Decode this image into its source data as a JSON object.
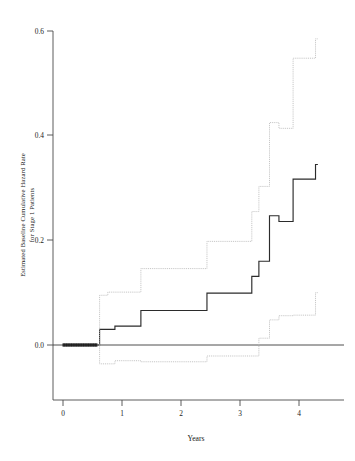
{
  "chart_data": {
    "type": "line",
    "title": "",
    "subtitle": "",
    "xlabel": "Years",
    "ylabel": "Estimated Baseline Cumulative Hazard Rate for Stage 1 Patients",
    "ylabel_line1": "Estimated Baseline Cumulative Hazard Rate",
    "ylabel_line2": "for Stage 1 Patients",
    "xlim": [
      -0.18,
      4.75
    ],
    "ylim": [
      -0.085,
      0.63
    ],
    "xticks": [
      0,
      1,
      2,
      3,
      4
    ],
    "xticklabels": [
      "0",
      "1",
      "2",
      "3",
      "4"
    ],
    "yticks": [
      0.0,
      0.2,
      0.4,
      0.6
    ],
    "yticklabels": [
      "0.0",
      "0.2",
      "0.4",
      "0.6"
    ],
    "grid": false,
    "legend": "none",
    "step_type": "post",
    "reference_line_y": 0.0,
    "series": [
      {
        "name": "Estimated baseline cumulative hazard",
        "style": "solid",
        "color": "#2b2b2b",
        "x": [
          0.0,
          0.58,
          0.62,
          0.78,
          0.88,
          1.28,
          1.32,
          2.4,
          2.44,
          3.16,
          3.2,
          3.28,
          3.32,
          3.46,
          3.5,
          3.62,
          3.66,
          3.86,
          3.9,
          4.24,
          4.28,
          4.32
        ],
        "y": [
          0.0,
          0.0,
          0.03,
          0.03,
          0.036,
          0.036,
          0.066,
          0.066,
          0.099,
          0.099,
          0.131,
          0.131,
          0.16,
          0.16,
          0.247,
          0.247,
          0.236,
          0.236,
          0.317,
          0.317,
          0.345,
          0.345
        ]
      },
      {
        "name": "Upper 95% confidence limit",
        "style": "dotted",
        "color": "#b9b9b9",
        "x": [
          0.0,
          0.58,
          0.62,
          0.72,
          0.76,
          1.28,
          1.32,
          2.4,
          2.44,
          3.16,
          3.2,
          3.28,
          3.32,
          3.46,
          3.5,
          3.62,
          3.66,
          3.86,
          3.9,
          4.24,
          4.28,
          4.32
        ],
        "y": [
          0.0,
          0.0,
          0.095,
          0.095,
          0.101,
          0.101,
          0.146,
          0.146,
          0.198,
          0.198,
          0.255,
          0.255,
          0.303,
          0.303,
          0.425,
          0.425,
          0.414,
          0.414,
          0.548,
          0.548,
          0.585,
          0.585
        ]
      },
      {
        "name": "Lower 95% confidence limit",
        "style": "dotted",
        "color": "#b9b9b9",
        "x": [
          0.0,
          0.58,
          0.62,
          0.78,
          0.88,
          1.28,
          1.32,
          2.4,
          2.44,
          3.16,
          3.2,
          3.28,
          3.32,
          3.46,
          3.5,
          3.62,
          3.66,
          3.86,
          3.9,
          4.24,
          4.28,
          4.32
        ],
        "y": [
          0.0,
          0.0,
          -0.036,
          -0.036,
          -0.03,
          -0.03,
          -0.032,
          -0.032,
          -0.021,
          -0.021,
          -0.021,
          -0.021,
          0.013,
          0.013,
          0.048,
          0.048,
          0.056,
          0.056,
          0.057,
          0.057,
          0.1,
          0.1
        ]
      }
    ],
    "censor_segment": {
      "description": "dense censoring tick marks along zero from x=0 to x=0.58",
      "x_start": 0.0,
      "x_end": 0.58,
      "y": 0.0
    }
  },
  "axes": {
    "x_axis_name": "years-axis",
    "y_axis_name": "hazard-axis"
  }
}
